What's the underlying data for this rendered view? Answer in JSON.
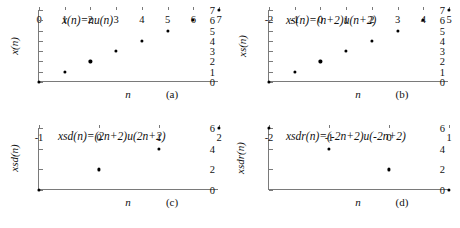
{
  "figure": {
    "layout": "2x2 grid of discrete-signal scatter plots",
    "point_color": "#000000",
    "axis_color": "#7a7a7a",
    "background": "#ffffff"
  },
  "chart_data": [
    {
      "type": "scatter",
      "id": "panel-a",
      "title": "x(n)=nu(n)",
      "caption": "(a)",
      "xlabel": "n",
      "ylabel": "x(n)",
      "x": [
        0,
        1,
        2,
        3,
        4,
        5,
        6,
        7
      ],
      "values": [
        0,
        1,
        2,
        3,
        4,
        5,
        6,
        7
      ],
      "xticks": [
        "0",
        "1",
        "2",
        "3",
        "4",
        "5",
        "6",
        "7"
      ],
      "xtickvals": [
        0,
        1,
        2,
        3,
        4,
        5,
        6,
        7
      ],
      "yticks": [
        "0",
        "1",
        "2",
        "3",
        "4",
        "5",
        "6",
        "7"
      ],
      "ytickvals": [
        0,
        1,
        2,
        3,
        4,
        5,
        6,
        7
      ],
      "xlim": [
        0,
        7
      ],
      "ylim": [
        0,
        7
      ],
      "grid": false,
      "legend": "none"
    },
    {
      "type": "scatter",
      "id": "panel-b",
      "title": "xs(n)=(n+2)u(n+2)",
      "caption": "(b)",
      "xlabel": "n",
      "ylabel": "xs(n)",
      "x": [
        -2,
        -1,
        0,
        1,
        2,
        3,
        4,
        5
      ],
      "values": [
        0,
        1,
        2,
        3,
        4,
        5,
        6,
        7
      ],
      "xticks": [
        "-2",
        "-1",
        "0",
        "1",
        "2",
        "3",
        "4",
        "5"
      ],
      "xtickvals": [
        -2,
        -1,
        0,
        1,
        2,
        3,
        4,
        5
      ],
      "yticks": [
        "0",
        "1",
        "2",
        "3",
        "4",
        "5",
        "6",
        "7"
      ],
      "ytickvals": [
        0,
        1,
        2,
        3,
        4,
        5,
        6,
        7
      ],
      "xlim": [
        -2,
        5
      ],
      "ylim": [
        0,
        7
      ],
      "grid": false,
      "legend": "none"
    },
    {
      "type": "scatter",
      "id": "panel-c",
      "title": "xsd(n)=(2n+2)u(2n+2)",
      "caption": "(c)",
      "xlabel": "n",
      "ylabel": "xsd(n)",
      "x": [
        -1,
        0,
        1,
        2
      ],
      "values": [
        0,
        2,
        4,
        6
      ],
      "xticks": [
        "-1",
        "0",
        "1",
        "2"
      ],
      "xtickvals": [
        -1,
        0,
        1,
        2
      ],
      "yticks": [
        "0",
        "2",
        "4",
        "6"
      ],
      "ytickvals": [
        0,
        2,
        4,
        6
      ],
      "xlim": [
        -1,
        2
      ],
      "ylim": [
        0,
        6
      ],
      "grid": false,
      "legend": "none"
    },
    {
      "type": "scatter",
      "id": "panel-d",
      "title": "xsdr(n)=(-2n+2)u(-2n+2)",
      "caption": "(d)",
      "xlabel": "n",
      "ylabel": "xsdr(n)",
      "x": [
        -2,
        -1,
        0,
        1
      ],
      "values": [
        6,
        4,
        2,
        0
      ],
      "xticks": [
        "-2",
        "-1",
        "0",
        "1"
      ],
      "xtickvals": [
        -2,
        -1,
        0,
        1
      ],
      "yticks": [
        "0",
        "2",
        "4",
        "6"
      ],
      "ytickvals": [
        0,
        2,
        4,
        6
      ],
      "xlim": [
        -2,
        1
      ],
      "ylim": [
        0,
        6
      ],
      "grid": false,
      "legend": "none"
    }
  ]
}
